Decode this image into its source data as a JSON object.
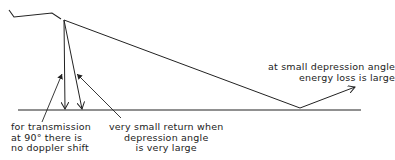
{
  "diagram": {
    "type": "sonar/radar beam reflection illustration",
    "colors": {
      "line": "#222222",
      "background": "#ffffff"
    },
    "elements": {
      "aircraft": "vessel-outline",
      "ground": "reflecting-surface"
    },
    "labels": {
      "left": "for transmission\nat 90° there is\nno doppler shift",
      "middle": "very small return when\ndepression angle\nis very large",
      "right": "at small depression angle\nenergy loss is large"
    }
  }
}
